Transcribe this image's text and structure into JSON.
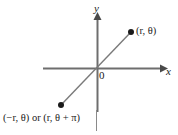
{
  "figure": {
    "kind": "polar-coordinate-diagram",
    "axes": {
      "x_label": "x",
      "y_label": "y",
      "origin_label": "0"
    },
    "points": [
      {
        "id": "upper-right",
        "label": "(r, θ)",
        "x": 131,
        "y": 32
      },
      {
        "id": "lower-left",
        "label": "(−r, θ) or (r, θ + π)",
        "x": 61,
        "y": 105
      }
    ],
    "colors": {
      "axis": "#6e6e6e",
      "ray": "#7a7a7a",
      "point": "#1a1a1a",
      "text": "#1a1a1a",
      "background": "#ffffff"
    }
  }
}
